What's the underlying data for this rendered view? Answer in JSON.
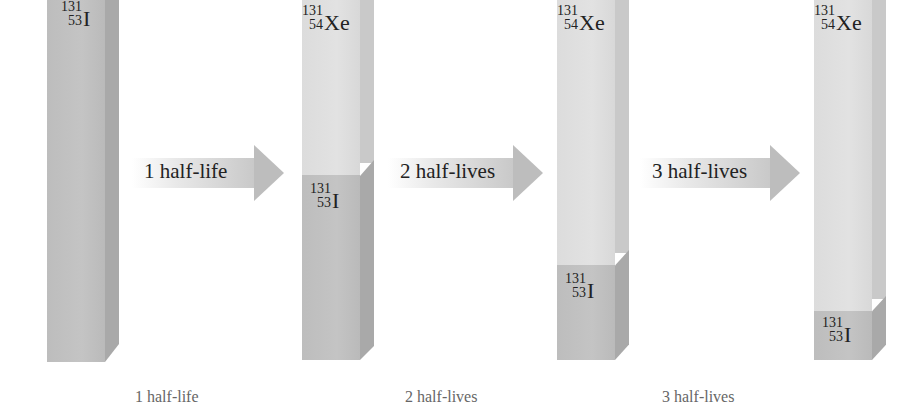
{
  "diagram": {
    "colors": {
      "xe_face": "#e0e0e0",
      "i_face": "#c0c0c0",
      "arrow": "#bdbdbd",
      "text": "#222222"
    },
    "nuclides": {
      "iodine": {
        "mass": "131",
        "atomic": "53",
        "symbol": "I"
      },
      "xenon": {
        "mass": "131",
        "atomic": "54",
        "symbol": "Xe"
      }
    },
    "bars": [
      {
        "stage": "start",
        "fraction_I": 1.0,
        "fraction_Xe": 0.0
      },
      {
        "stage": "1 half-life",
        "fraction_I": 0.5,
        "fraction_Xe": 0.5
      },
      {
        "stage": "2 half-lives",
        "fraction_I": 0.25,
        "fraction_Xe": 0.75
      },
      {
        "stage": "3 half-lives",
        "fraction_I": 0.125,
        "fraction_Xe": 0.875
      }
    ],
    "arrows": [
      {
        "label": "1 half-life"
      },
      {
        "label": "2 half-lives"
      },
      {
        "label": "3 half-lives"
      }
    ],
    "captions": [
      {
        "label": "1 half-life"
      },
      {
        "label": "2 half-lives"
      },
      {
        "label": "3 half-lives"
      }
    ]
  }
}
